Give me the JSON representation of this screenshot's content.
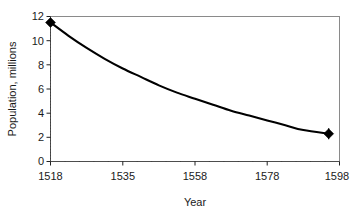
{
  "chart_data": {
    "type": "line",
    "title": "",
    "xlabel": "Year",
    "ylabel": "Population, millions",
    "xlim": [
      1518,
      1598
    ],
    "ylim": [
      0,
      12
    ],
    "grid": false,
    "legend": false,
    "legend_position": "none",
    "x_tick_labels": [
      "1518",
      "1535",
      "1558",
      "1578",
      "1598"
    ],
    "x_tick_values": [
      1518,
      1535,
      1558,
      1578,
      1598
    ],
    "y_tick_labels": [
      "0",
      "2",
      "4",
      "6",
      "8",
      "10",
      "12"
    ],
    "y_tick_values": [
      0,
      2,
      4,
      6,
      8,
      10,
      12
    ],
    "x_minor_tick_count": 20,
    "y_minor_tick_count": 48,
    "series": [
      {
        "name": "Population",
        "marker": "diamond",
        "color": "#000000",
        "x": [
          1518,
          1523,
          1528,
          1533,
          1538,
          1543,
          1548,
          1553,
          1558,
          1563,
          1568,
          1573,
          1578,
          1583,
          1588,
          1595
        ],
        "values": [
          11.5,
          10.4,
          9.4,
          8.5,
          7.7,
          7.0,
          6.3,
          5.7,
          5.2,
          4.7,
          4.2,
          3.8,
          3.4,
          3.0,
          2.6,
          2.3
        ]
      }
    ],
    "markers": [
      {
        "label": "start-point",
        "x": 1518,
        "y": 11.5,
        "error": 0.0
      },
      {
        "label": "end-point",
        "x": 1595,
        "y": 2.3,
        "error": 0.45
      }
    ],
    "annotations": []
  },
  "axis": {
    "y_title": "Population, millions",
    "x_title": "Year"
  },
  "ticks": {
    "y": {
      "t0": "0",
      "t1": "2",
      "t2": "4",
      "t3": "6",
      "t4": "8",
      "t5": "10",
      "t6": "12"
    },
    "x": {
      "t0": "1518",
      "t1": "1535",
      "t2": "1558",
      "t3": "1578",
      "t4": "1598"
    }
  }
}
